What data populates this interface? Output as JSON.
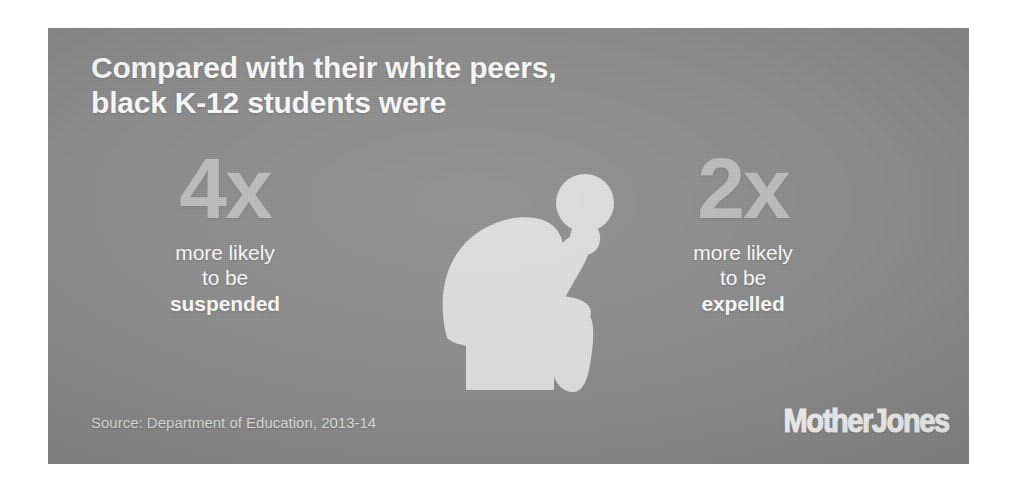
{
  "panel": {
    "background_color": "#8b8b8b",
    "headline": "Compared with their white peers,\nblack K-12 students were"
  },
  "stats": [
    {
      "id": "suspended",
      "figure": "4x",
      "figure_color": "#bdbdbd",
      "line1": "more likely",
      "line2": "to be",
      "line3": "suspended"
    },
    {
      "id": "expelled",
      "figure": "2x",
      "figure_color": "#bdbdbd",
      "line1": "more likely",
      "line2": "to be",
      "line3": "expelled"
    }
  ],
  "illustration": {
    "name": "seated-thinking-person-pictogram",
    "color": "#e0e0e0"
  },
  "footer": {
    "source": "Source: Department of Education, 2013-14",
    "logo": "MotherJones"
  }
}
